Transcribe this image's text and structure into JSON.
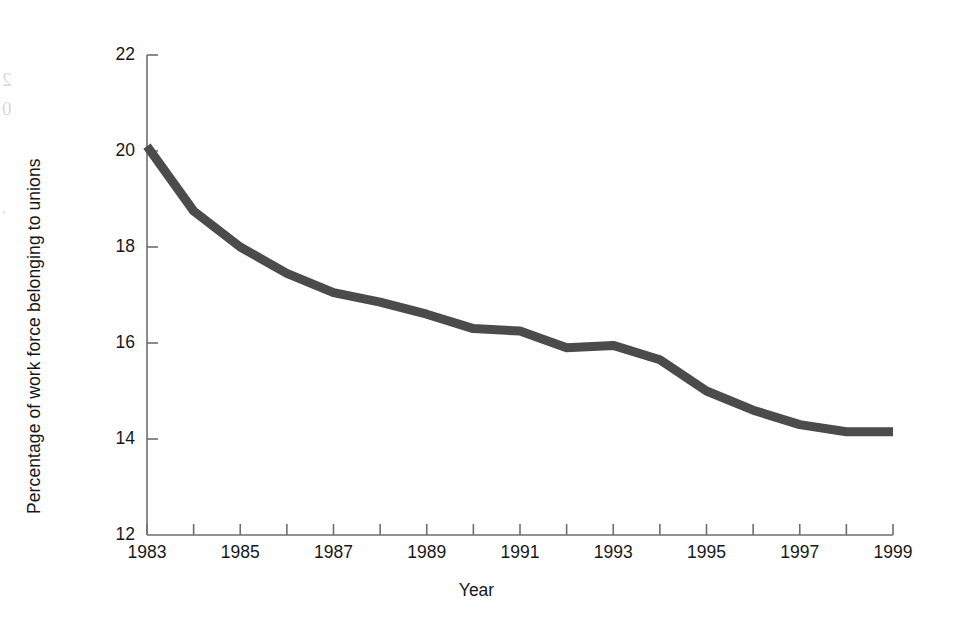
{
  "chart_data": {
    "type": "line",
    "title": "",
    "xlabel": "Year",
    "ylabel": "Percentage of work force belonging to unions",
    "xlim": [
      1983,
      1999
    ],
    "ylim": [
      12,
      22
    ],
    "grid": false,
    "legend": null,
    "line_color": "#4b4b4b",
    "line_width_px": 9,
    "axis_color": "#6e6e6e",
    "x": [
      1983,
      1984,
      1985,
      1986,
      1987,
      1988,
      1989,
      1990,
      1991,
      1992,
      1993,
      1994,
      1995,
      1996,
      1997,
      1998,
      1999
    ],
    "values": [
      20.1,
      18.75,
      18.0,
      17.45,
      17.05,
      16.85,
      16.6,
      16.3,
      16.25,
      15.9,
      15.95,
      15.65,
      15.0,
      14.6,
      14.3,
      14.15,
      14.15
    ],
    "series": [
      {
        "name": "Percentage of work force belonging to unions",
        "values": [
          20.1,
          18.75,
          18.0,
          17.45,
          17.05,
          16.85,
          16.6,
          16.3,
          16.25,
          15.9,
          15.95,
          15.65,
          15.0,
          14.6,
          14.3,
          14.15,
          14.15
        ]
      }
    ],
    "yticks": [
      12,
      14,
      16,
      18,
      20,
      22
    ],
    "ytick_labels": [
      "12",
      "14",
      "16",
      "18",
      "20",
      "22"
    ],
    "xticks": [
      1983,
      1984,
      1985,
      1986,
      1987,
      1988,
      1989,
      1990,
      1991,
      1992,
      1993,
      1994,
      1995,
      1996,
      1997,
      1998,
      1999
    ],
    "xtick_labels": [
      "1983",
      "",
      "1985",
      "",
      "1987",
      "",
      "1989",
      "",
      "1991",
      "",
      "1993",
      "",
      "1995",
      "",
      "1997",
      "",
      "1999"
    ]
  },
  "artifacts": {
    "bleed_1": "2",
    "bleed_2": "0",
    "bleed_3": ","
  }
}
